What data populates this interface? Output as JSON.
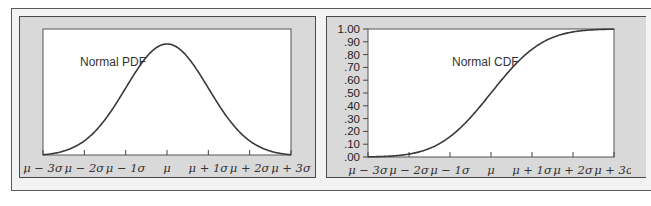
{
  "chart_data": [
    {
      "type": "line",
      "title": "",
      "annotation": "Normal PDF",
      "xlabel": "",
      "ylabel": "",
      "x_tick_labels": [
        "μ − 3σ",
        "μ − 2σ",
        "μ − 1σ",
        "μ",
        "μ + 1σ",
        "μ + 2σ",
        "μ + 3σ"
      ],
      "x": [
        -3,
        -2.5,
        -2,
        -1.5,
        -1,
        -0.5,
        0,
        0.5,
        1,
        1.5,
        2,
        2.5,
        3
      ],
      "series": [
        {
          "name": "Normal PDF",
          "values": [
            0.0044,
            0.0175,
            0.054,
            0.1295,
            0.242,
            0.3521,
            0.3989,
            0.3521,
            0.242,
            0.1295,
            0.054,
            0.0175,
            0.0044
          ]
        }
      ],
      "xlim": [
        -3,
        3
      ],
      "ylim": [
        0,
        0.45
      ],
      "grid": false,
      "y_axis_labels_shown": false
    },
    {
      "type": "line",
      "title": "",
      "annotation": "Normal CDF",
      "xlabel": "",
      "ylabel": "",
      "x_tick_labels": [
        "μ − 3σ",
        "μ − 2σ",
        "μ − 1σ",
        "μ",
        "μ + 1σ",
        "μ + 2σ",
        "μ + 3σ"
      ],
      "y_tick_labels": [
        "1.00",
        ".90",
        ".80",
        ".70",
        ".60",
        ".50",
        ".40",
        ".30",
        ".20",
        ".10",
        ".00"
      ],
      "x": [
        -3,
        -2.5,
        -2,
        -1.5,
        -1,
        -0.5,
        0,
        0.5,
        1,
        1.5,
        2,
        2.5,
        3
      ],
      "series": [
        {
          "name": "Normal CDF",
          "values": [
            0.0013,
            0.0062,
            0.0228,
            0.0668,
            0.1587,
            0.3085,
            0.5,
            0.6915,
            0.8413,
            0.9332,
            0.9772,
            0.9938,
            0.9987
          ]
        }
      ],
      "xlim": [
        -3,
        3
      ],
      "ylim": [
        0,
        1
      ],
      "grid": false
    }
  ],
  "pdf_panel": {
    "annotation": "Normal PDF",
    "x_ticks": [
      "μ − 3σ",
      "μ − 2σ",
      "μ − 1σ",
      "μ",
      "μ + 1σ",
      "μ + 2σ",
      "μ + 3σ"
    ]
  },
  "cdf_panel": {
    "annotation": "Normal CDF",
    "x_ticks": [
      "μ − 3σ",
      "μ − 2σ",
      "μ − 1σ",
      "μ",
      "μ + 1σ",
      "μ + 2σ",
      "μ + 3σ"
    ],
    "y_ticks": [
      "1.00",
      ".90",
      ".80",
      ".70",
      ".60",
      ".50",
      ".40",
      ".30",
      ".20",
      ".10",
      ".00"
    ]
  },
  "colors": {
    "panel_bg": "#d9d9d9",
    "plot_bg": "#ffffff",
    "curve": "#3a3a3a",
    "frame_border": "#4a4a4a"
  }
}
